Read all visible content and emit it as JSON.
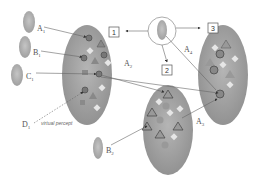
{
  "diagram": {
    "sources": [
      {
        "id": "A1",
        "base": "A",
        "sub": "1"
      },
      {
        "id": "B1",
        "base": "B",
        "sub": "1"
      },
      {
        "id": "C1",
        "base": "C",
        "sub": "1"
      },
      {
        "id": "D1",
        "base": "D",
        "sub": "1"
      },
      {
        "id": "B2",
        "base": "B",
        "sub": "2"
      }
    ],
    "clusters": [
      {
        "id": "1",
        "label": "1"
      },
      {
        "id": "2",
        "label": "2"
      },
      {
        "id": "3",
        "label": "3"
      }
    ],
    "edge_labels": [
      {
        "id": "A2",
        "base": "A",
        "sub": "2"
      },
      {
        "id": "A3",
        "base": "A",
        "sub": "3"
      },
      {
        "id": "A4",
        "base": "A",
        "sub": "4"
      }
    ],
    "annotation": "virtual percept",
    "colors": {
      "ellipse_fill": "#9a9a9a",
      "line": "#666666",
      "box_stroke": "#555555"
    }
  }
}
